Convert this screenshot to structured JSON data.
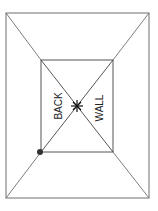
{
  "diagram": {
    "type": "room-perspective",
    "labels": {
      "back": "BACK",
      "wall": "WALL"
    },
    "colors": {
      "line": "#6e6e6e",
      "ink": "#222222",
      "background": "#ffffff"
    },
    "outer_rect": {
      "x1": 6,
      "y1": 13,
      "x2": 149,
      "y2": 198
    },
    "inner_rect": {
      "x1": 41,
      "y1": 60,
      "x2": 113,
      "y2": 152
    },
    "vanishing_point": {
      "x": 77,
      "y": 106
    },
    "marker_dot": {
      "x": 40,
      "y": 152
    }
  }
}
